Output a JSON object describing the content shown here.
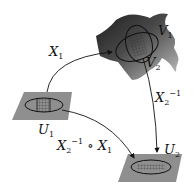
{
  "diagram": {
    "colors": {
      "background": "#ffffff",
      "plane_fill": "#8f8f8f",
      "surface_dark": "#2e2e2e",
      "surface_light": "#9a9a9a",
      "stroke": "#111111"
    },
    "nodes": {
      "U1": {
        "label": "U",
        "sub": "1"
      },
      "U2": {
        "label": "U",
        "sub": "2"
      },
      "V1": {
        "label": "V",
        "sub": "1"
      },
      "V2": {
        "label": "V",
        "sub": "2"
      }
    },
    "edges": {
      "X1": {
        "label": "X",
        "sub": "1",
        "from": "U1",
        "to": "V1"
      },
      "X2inv": {
        "label": "X",
        "sub": "2",
        "sup": "−1",
        "from": "V2",
        "to": "U2"
      },
      "transition": {
        "label1": "X",
        "sub1": "2",
        "sup1": "−1",
        "op": " ∘ ",
        "label2": "X",
        "sub2": "1",
        "from": "U1",
        "to": "U2"
      }
    }
  }
}
